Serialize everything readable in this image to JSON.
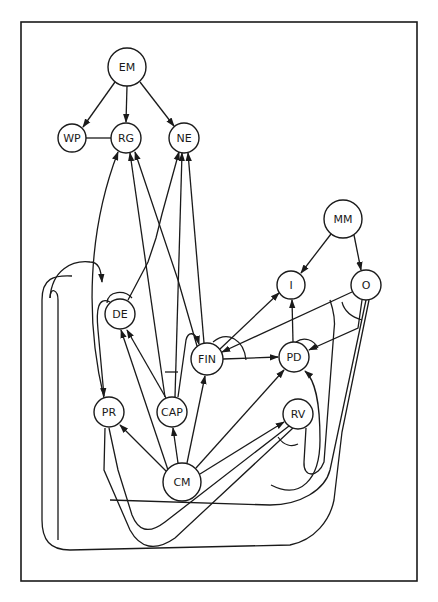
{
  "diagram": {
    "type": "directed-graph",
    "frame": {
      "x": 21,
      "y": 22,
      "width": 396,
      "height": 559
    },
    "colors": {
      "stroke": "#1a1a1a",
      "background": "#ffffff"
    },
    "nodes": [
      {
        "id": "EM",
        "label": "EM",
        "x": 127,
        "y": 67,
        "r": 19
      },
      {
        "id": "WP",
        "label": "WP",
        "x": 72,
        "y": 138,
        "r": 14
      },
      {
        "id": "RG",
        "label": "RG",
        "x": 126,
        "y": 138,
        "r": 15
      },
      {
        "id": "NE",
        "label": "NE",
        "x": 184,
        "y": 138,
        "r": 15
      },
      {
        "id": "MM",
        "label": "MM",
        "x": 343,
        "y": 219,
        "r": 19
      },
      {
        "id": "I",
        "label": "I",
        "x": 291,
        "y": 285,
        "r": 14
      },
      {
        "id": "O",
        "label": "O",
        "x": 366,
        "y": 285,
        "r": 15
      },
      {
        "id": "DE",
        "label": "DE",
        "x": 120,
        "y": 314,
        "r": 15
      },
      {
        "id": "FIN",
        "label": "FIN",
        "x": 207,
        "y": 359,
        "r": 16
      },
      {
        "id": "PD",
        "label": "PD",
        "x": 294,
        "y": 357,
        "r": 15
      },
      {
        "id": "PR",
        "label": "PR",
        "x": 109,
        "y": 412,
        "r": 15
      },
      {
        "id": "CAP",
        "label": "CAP",
        "x": 172,
        "y": 412,
        "r": 15
      },
      {
        "id": "RV",
        "label": "RV",
        "x": 298,
        "y": 414,
        "r": 15
      },
      {
        "id": "CM",
        "label": "CM",
        "x": 182,
        "y": 482,
        "r": 19
      }
    ],
    "edges": [
      {
        "from": "EM",
        "to": "WP",
        "directed": true
      },
      {
        "from": "EM",
        "to": "RG",
        "directed": true
      },
      {
        "from": "EM",
        "to": "NE",
        "directed": true
      },
      {
        "from": "WP",
        "to": "RG",
        "directed": false
      },
      {
        "from": "MM",
        "to": "I",
        "directed": true
      },
      {
        "from": "MM",
        "to": "O",
        "directed": true
      },
      {
        "from": "FIN",
        "to": "I",
        "directed": true
      },
      {
        "from": "O",
        "to": "FIN",
        "directed": true
      },
      {
        "from": "FIN",
        "to": "PD",
        "directed": true
      },
      {
        "from": "PD",
        "to": "I",
        "directed": true
      },
      {
        "from": "O",
        "to": "PD",
        "directed": true
      },
      {
        "from": "PR",
        "to": "RG",
        "directed": true
      },
      {
        "from": "DE",
        "to": "PR",
        "directed": true
      },
      {
        "from": "CAP",
        "to": "RG",
        "directed": true
      },
      {
        "from": "FIN",
        "to": "RG",
        "directed": true
      },
      {
        "from": "DE",
        "to": "NE",
        "directed": true
      },
      {
        "from": "CAP",
        "to": "NE",
        "directed": true
      },
      {
        "from": "FIN",
        "to": "NE",
        "directed": true
      },
      {
        "from": "CM",
        "to": "DE",
        "directed": true
      },
      {
        "from": "CAP",
        "to": "DE",
        "directed": true
      },
      {
        "from": "CAP",
        "to": "FIN",
        "directed": true
      },
      {
        "from": "CM",
        "to": "PR",
        "directed": true
      },
      {
        "from": "CM",
        "to": "CAP",
        "directed": true
      },
      {
        "from": "CM",
        "to": "FIN",
        "directed": true
      },
      {
        "from": "CM",
        "to": "PD",
        "directed": true
      },
      {
        "from": "CM",
        "to": "RV",
        "directed": true
      },
      {
        "from": "RV",
        "to": "PD",
        "directed": true
      },
      {
        "from": "RV",
        "to": "PR",
        "directed": true
      },
      {
        "from": "O",
        "to": "PR",
        "directed": true
      },
      {
        "from": "RV",
        "to": "RV",
        "directed": true
      }
    ]
  }
}
